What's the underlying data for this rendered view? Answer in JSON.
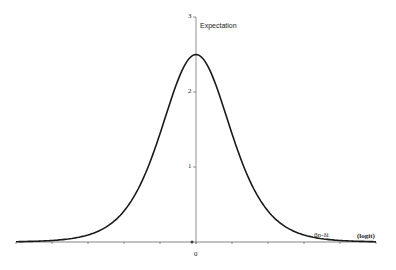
{
  "chart_data": {
    "type": "line",
    "title": "",
    "xlabel": "(logit)",
    "ylabel": "Expectation",
    "x_annotation": "βn-δi",
    "xlim": [
      -5,
      5
    ],
    "ylim": [
      0,
      3
    ],
    "yticks": [
      "0",
      "1",
      "2",
      "3"
    ],
    "xticks_labeled": [
      "0"
    ],
    "grid": false,
    "legend": "none",
    "series": [
      {
        "name": "Expectation curve",
        "x": [
          -5,
          -4,
          -3,
          -2.5,
          -2,
          -1.5,
          -1,
          -0.5,
          0,
          0.5,
          1,
          1.5,
          2,
          2.5,
          3,
          4,
          5
        ],
        "y": [
          0.02,
          0.1,
          0.35,
          0.6,
          0.95,
          1.4,
          1.85,
          2.3,
          2.5,
          2.3,
          1.85,
          1.4,
          0.95,
          0.6,
          0.35,
          0.1,
          0.02
        ]
      }
    ]
  },
  "labels": {
    "ylabel": "Expectation",
    "xlabel": "(logit)",
    "annotation": "βn-δi",
    "ytick_3": "3",
    "ytick_2": "2",
    "ytick_1": "1",
    "xtick_0": "0"
  },
  "colors": {
    "curve": "#1a1a1a",
    "axis": "#555555"
  }
}
